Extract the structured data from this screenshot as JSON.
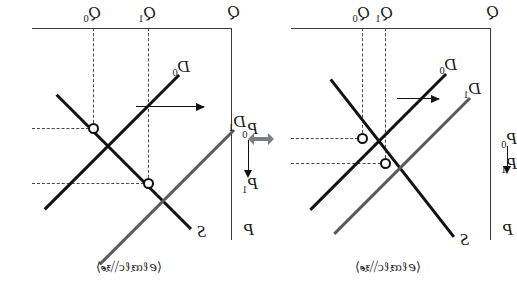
{
  "figure": {
    "connector_icon": "double-headed-horizontal-arrow",
    "connector_color": "#7d7d85"
  },
  "panels": [
    {
      "id": "elastic-supply",
      "caption": "⟨ℯℓαⲝℓс⧹⧹ⲝℯ⟩",
      "axis_quantity_label": "Q",
      "axis_price_label": "P",
      "quantity_ticks": [
        {
          "label": "Q",
          "sub": "0"
        },
        {
          "label": "Q",
          "sub": "1"
        }
      ],
      "price_ticks": [
        {
          "label": "P",
          "sub": "0"
        },
        {
          "label": "P",
          "sub": "1"
        }
      ],
      "curves": [
        {
          "name": "supply",
          "label": "S",
          "sub": "",
          "color": "#111111"
        },
        {
          "name": "demand-initial",
          "label": "D",
          "sub": "0",
          "color": "#111111"
        },
        {
          "name": "demand-new",
          "label": "D",
          "sub": "1",
          "color": "#5a5a5a"
        }
      ],
      "shift_direction": "leftward",
      "price_change_direction": "downward"
    },
    {
      "id": "inelastic-supply",
      "caption": "⟨ℯℓαⲝℓс⧹⧹ⲝℯ⟩",
      "axis_quantity_label": "Q",
      "axis_price_label": "P",
      "quantity_ticks": [
        {
          "label": "Q",
          "sub": "0"
        },
        {
          "label": "Q",
          "sub": "1"
        }
      ],
      "price_ticks": [
        {
          "label": "P",
          "sub": "0"
        },
        {
          "label": "P",
          "sub": "1"
        }
      ],
      "curves": [
        {
          "name": "supply",
          "label": "S",
          "sub": "",
          "color": "#111111"
        },
        {
          "name": "demand-initial",
          "label": "D",
          "sub": "0",
          "color": "#111111"
        },
        {
          "name": "demand-new",
          "label": "D",
          "sub": "1",
          "color": "#5a5a5a"
        }
      ],
      "shift_direction": "leftward",
      "price_change_direction": "downward"
    }
  ]
}
